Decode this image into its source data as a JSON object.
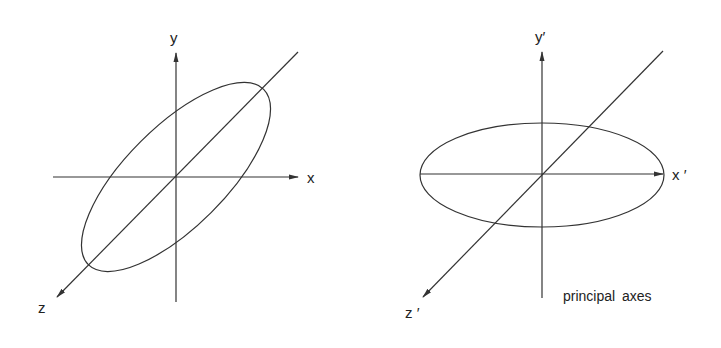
{
  "left_diagram": {
    "axes": {
      "x": "x",
      "y": "y",
      "z": "z"
    },
    "shape": "ellipse-rotated"
  },
  "right_diagram": {
    "axes": {
      "x": "x ′",
      "y": "y′",
      "z": "z ′"
    },
    "shape": "ellipse-aligned",
    "caption": "principal axes"
  },
  "colors": {
    "line": "#333333",
    "background": "#ffffff"
  }
}
